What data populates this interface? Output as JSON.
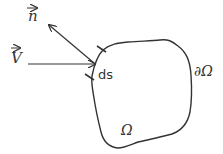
{
  "diagram": {
    "labels": {
      "normal_vector": "n",
      "velocity_vector": "V",
      "surface_element": "ds",
      "boundary": "∂Ω",
      "domain": "Ω"
    },
    "colors": {
      "stroke": "#333333",
      "text": "#333333",
      "background": "#ffffff"
    }
  }
}
